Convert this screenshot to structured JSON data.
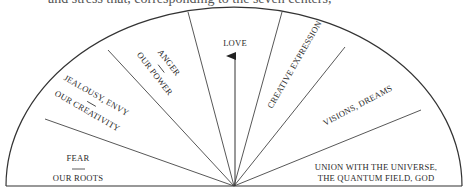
{
  "top_text_fragment": "and stress that, corresponding to the seven centers,",
  "diagram": {
    "type": "semicircle-fan",
    "segments": [
      {
        "id": "fear",
        "line1": "FEAR",
        "separator": "—",
        "line2": "OUR ROOTS"
      },
      {
        "id": "jealousy",
        "line1": "JEALOUSY, ENVY",
        "separator": "—",
        "line2": "OUR CREATIVITY"
      },
      {
        "id": "anger",
        "line1": "ANGER",
        "separator": "—",
        "line2": "OUR POWER"
      },
      {
        "id": "love",
        "line1": "LOVE"
      },
      {
        "id": "creative",
        "line1": "CREATIVE EXPRESSION"
      },
      {
        "id": "visions",
        "line1": "VISIONS, DREAMS"
      },
      {
        "id": "union",
        "line1": "UNION WITH THE UNIVERSE,",
        "line2": "THE QUANTUM FIELD, GOD"
      }
    ],
    "arrow": {
      "direction": "up",
      "segment": "love"
    },
    "colors": {
      "line": "#333333",
      "text": "#2a2a2a",
      "background": "#ffffff"
    }
  }
}
